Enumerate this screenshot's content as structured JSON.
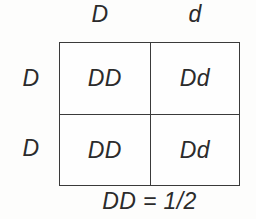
{
  "diagram": {
    "type": "punnett-square",
    "grid_size": "2x2",
    "column_headers": [
      "D",
      "d"
    ],
    "row_headers": [
      "D",
      "D"
    ],
    "cells": [
      [
        "DD",
        "Dd"
      ],
      [
        "DD",
        "Dd"
      ]
    ],
    "caption": "DD = 1/2",
    "colors": {
      "background": "#fdfdfc",
      "text": "#2b2b2b",
      "border": "#3a3a3a"
    }
  }
}
